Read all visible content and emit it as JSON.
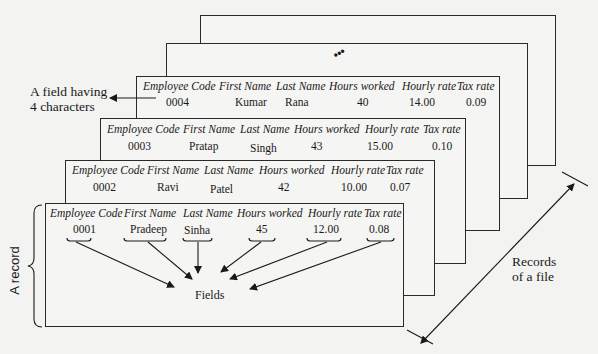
{
  "diagram": {
    "headers": [
      "Employee Code",
      "First Name",
      "Last Name",
      "Hours worked",
      "Hourly rate",
      "Tax rate"
    ],
    "records": [
      {
        "code": "0001",
        "first": "Pradeep",
        "last": "Sinha",
        "hours": "45",
        "rate": "12.00",
        "tax": "0.08"
      },
      {
        "code": "0002",
        "first": "Ravi",
        "last": "Patel",
        "hours": "42",
        "rate": "10.00",
        "tax": "0.07"
      },
      {
        "code": "0003",
        "first": "Pratap",
        "last": "Singh",
        "hours": "43",
        "rate": "15.00",
        "tax": "0.10"
      },
      {
        "code": "0004",
        "first": "Kumar",
        "last": "Rana",
        "hours": "40",
        "rate": "14.00",
        "tax": "0.09"
      }
    ],
    "continuation": "•••",
    "labels": {
      "field_line1": "A field having",
      "field_line2": "4 characters",
      "record": "A record",
      "fields": "Fields",
      "records_line1": "Records",
      "records_line2": "of a file"
    },
    "colors": {
      "line": "#1a1a1a",
      "paper": "#f5f5f3",
      "background": "#f3f3f1"
    }
  }
}
